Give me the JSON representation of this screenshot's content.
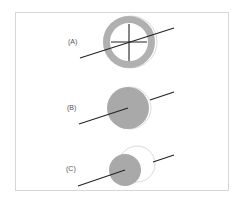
{
  "diagram": {
    "frame": {
      "stroke": "#d6d6d6"
    },
    "colors": {
      "disc_fill": "#a9a9a9",
      "ring_fill": "#b0b0b0",
      "outline": "#cfcfcf",
      "line": "#222222"
    },
    "panels": [
      {
        "label": "(A)",
        "description": "gray ring with crosshair; line passes through center"
      },
      {
        "label": "(B)",
        "description": "gray disc; line enters from left to center, exits behind on right"
      },
      {
        "label": "(C)",
        "description": "smaller gray disc offset left of a white outlined circle; line through both"
      }
    ]
  }
}
